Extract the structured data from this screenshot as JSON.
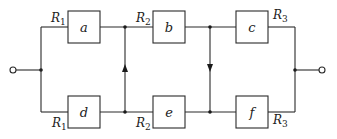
{
  "diagram": {
    "boxes": [
      {
        "id": "a",
        "label": "a",
        "resistor": "R",
        "subscript": "1",
        "branch": "top"
      },
      {
        "id": "b",
        "label": "b",
        "resistor": "R",
        "subscript": "2",
        "branch": "top"
      },
      {
        "id": "c",
        "label": "c",
        "resistor": "R",
        "subscript": "3",
        "branch": "top"
      },
      {
        "id": "d",
        "label": "d",
        "resistor": "R",
        "subscript": "1",
        "branch": "bottom"
      },
      {
        "id": "e",
        "label": "e",
        "resistor": "R",
        "subscript": "2",
        "branch": "bottom"
      },
      {
        "id": "f",
        "label": "f",
        "resistor": "R",
        "subscript": "3",
        "branch": "bottom"
      }
    ],
    "cross_links": [
      {
        "between": "d-e to a-b",
        "direction": "up"
      },
      {
        "between": "b-c to e-f",
        "direction": "down"
      }
    ],
    "terminals": [
      "input",
      "output"
    ],
    "colors": {
      "line": "#2a2a2a",
      "background": "#ffffff"
    }
  }
}
